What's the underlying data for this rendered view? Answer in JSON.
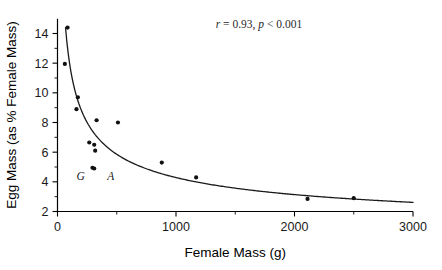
{
  "chart_data": {
    "type": "scatter",
    "title": "",
    "xlabel": "Female Mass (g)",
    "ylabel": "Egg Mass (as % Female Mass)",
    "xlim": [
      0,
      3000
    ],
    "ylim": [
      2,
      15
    ],
    "grid": false,
    "legend": "none",
    "x_ticks": [
      0,
      1000,
      2000,
      3000
    ],
    "x_tick_labels": [
      "0",
      "1000",
      "2000",
      "3000"
    ],
    "x_minor_ticks": [
      500,
      1500,
      2500
    ],
    "y_ticks": [
      2,
      4,
      6,
      8,
      10,
      12,
      14
    ],
    "y_tick_labels": [
      "2",
      "4",
      "6",
      "8",
      "10",
      "12",
      "14"
    ],
    "y_minor_ticks": [
      3,
      5,
      7,
      9,
      11,
      13
    ],
    "points": [
      {
        "x": 85,
        "y": 14.4
      },
      {
        "x": 62,
        "y": 11.95
      },
      {
        "x": 172,
        "y": 9.7
      },
      {
        "x": 160,
        "y": 8.9
      },
      {
        "x": 330,
        "y": 8.15
      },
      {
        "x": 510,
        "y": 8.0
      },
      {
        "x": 268,
        "y": 6.65
      },
      {
        "x": 310,
        "y": 6.5
      },
      {
        "x": 318,
        "y": 6.1
      },
      {
        "x": 295,
        "y": 4.95
      },
      {
        "x": 310,
        "y": 4.9
      },
      {
        "x": 880,
        "y": 5.3
      },
      {
        "x": 1170,
        "y": 4.3
      },
      {
        "x": 2110,
        "y": 2.85
      },
      {
        "x": 2500,
        "y": 2.9
      }
    ],
    "point_labels": [
      {
        "text": "G",
        "x": 195,
        "y": 4.1
      },
      {
        "text": "A",
        "x": 450,
        "y": 4.1
      }
    ],
    "fit_curve": {
      "description": "power-law decay fit",
      "coefficient": 96.0,
      "exponent": -0.45,
      "x_start": 45,
      "x_end": 3000
    },
    "annotation": {
      "r_symbol": "r",
      "r_text": " = 0.93, ",
      "p_symbol": "p",
      "p_text": " < 0.001",
      "full_text": "r = 0.93, p < 0.001",
      "x": 1700,
      "y": 14.4
    },
    "colors": {
      "point": "#111111",
      "curve": "#1a1a1a",
      "axis": "#000000",
      "background": "#ffffff"
    }
  }
}
